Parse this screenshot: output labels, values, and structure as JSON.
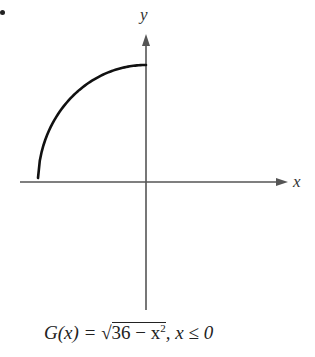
{
  "chart_data": {
    "type": "line",
    "title": "",
    "xlabel": "x",
    "ylabel": "y",
    "caption": "G(x) = √(36 − x²), x ≤ 0",
    "function": "sqrt(36 - x^2)",
    "domain": [
      -6,
      0
    ],
    "range": [
      0,
      6
    ],
    "x": [
      -6,
      -5.5,
      -5,
      -4,
      -3,
      -2,
      -1,
      0
    ],
    "values": [
      0,
      2.4,
      3.32,
      4.47,
      5.2,
      5.66,
      5.92,
      6
    ],
    "grid": false,
    "legend": null,
    "tick_labels": false,
    "colors": {
      "curve": "#111111",
      "axes": "#555555",
      "text": "#222222"
    }
  },
  "labels": {
    "x_axis": "x",
    "y_axis": "y",
    "caption_lhs": "G(x) = ",
    "caption_radical": "√",
    "caption_radicand": "36 − x",
    "caption_exponent": "2",
    "caption_tail": ",  x ≤ 0"
  }
}
